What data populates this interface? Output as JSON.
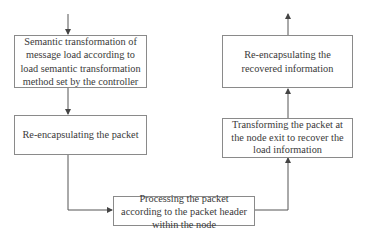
{
  "diagram": {
    "type": "flowchart",
    "nodes": [
      {
        "id": "semantic_transform",
        "label": "Semantic transformation of message load according to load semantic transformation method set by the controller"
      },
      {
        "id": "reencap_packet",
        "label": "Re-encapsulating the packet"
      },
      {
        "id": "process_packet",
        "label": "Processing the packet according to the packet header within the node"
      },
      {
        "id": "transform_exit",
        "label": "Transforming the packet at the node exit to recover the load information"
      },
      {
        "id": "reencap_recovered",
        "label": "Re-encapsulating the recovered information"
      }
    ],
    "edges": [
      {
        "from": "input",
        "to": "semantic_transform"
      },
      {
        "from": "semantic_transform",
        "to": "reencap_packet"
      },
      {
        "from": "reencap_packet",
        "to": "process_packet"
      },
      {
        "from": "process_packet",
        "to": "transform_exit"
      },
      {
        "from": "transform_exit",
        "to": "reencap_recovered"
      },
      {
        "from": "reencap_recovered",
        "to": "output"
      }
    ],
    "colors": {
      "line": "#555555",
      "border": "#8a8a8a",
      "text": "#3a3a3a"
    }
  }
}
